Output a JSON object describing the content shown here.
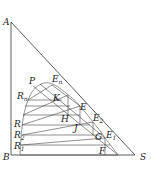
{
  "diagram": {
    "type": "ternary-extraction-diagram",
    "vertices": {
      "A": "A",
      "B": "B",
      "S": "S"
    },
    "points": {
      "P": "P",
      "En": "E",
      "En_sub": "n",
      "Rn": "R",
      "Rn_sub": "n",
      "K": "K",
      "E": "E",
      "E2": "E",
      "E2_sub": "2",
      "E1": "E",
      "E1_sub": "1",
      "H": "H",
      "J": "J",
      "G": "G",
      "F": "F",
      "R": "R",
      "R2": "R",
      "R2_sub": "2",
      "R1": "R",
      "R1_sub": "1"
    },
    "colors": {
      "line": "#333333",
      "curve": "#777777",
      "background": "#ffffff"
    }
  }
}
